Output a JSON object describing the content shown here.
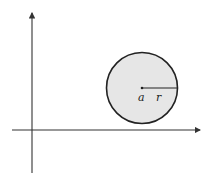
{
  "diagram": {
    "axes": {
      "x_axis": {
        "y": 130,
        "x_start": 12,
        "x_end": 200
      },
      "y_axis": {
        "x": 32,
        "y_start": 173,
        "y_end": 13
      }
    },
    "circle": {
      "cx": 142,
      "cy": 88,
      "r": 35.5,
      "fill": "#e6e6e6",
      "stroke": "#222222",
      "center_label": "a",
      "radius_label": "r"
    }
  }
}
